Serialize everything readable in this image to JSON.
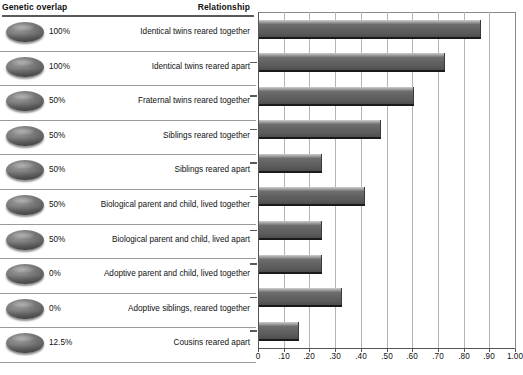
{
  "table": {
    "headers": {
      "overlap": "Genetic overlap",
      "relationship": "Relationship"
    },
    "rows": [
      {
        "overlap": "100%",
        "relationship": "Identical twins reared together"
      },
      {
        "overlap": "100%",
        "relationship": "Identical twins reared apart"
      },
      {
        "overlap": "50%",
        "relationship": "Fraternal twins reared together"
      },
      {
        "overlap": "50%",
        "relationship": "Siblings reared together"
      },
      {
        "overlap": "50%",
        "relationship": "Siblings reared apart"
      },
      {
        "overlap": "50%",
        "relationship": "Biological parent and child, lived together"
      },
      {
        "overlap": "50%",
        "relationship": "Biological parent and child, lived apart"
      },
      {
        "overlap": "0%",
        "relationship": "Adoptive parent and child, lived together"
      },
      {
        "overlap": "0%",
        "relationship": "Adoptive siblings, reared together"
      },
      {
        "overlap": "12.5%",
        "relationship": "Cousins reared apart"
      }
    ]
  },
  "chart_data": {
    "type": "bar",
    "orientation": "horizontal",
    "title": "",
    "xlabel": "",
    "ylabel": "",
    "xlim": [
      0,
      1.0
    ],
    "grid": true,
    "legend": "none",
    "categories": [
      "Identical twins reared together",
      "Identical twins reared apart",
      "Fraternal twins reared together",
      "Siblings reared together",
      "Siblings reared apart",
      "Biological parent and child, lived together",
      "Biological parent and child, lived apart",
      "Adoptive parent and child, lived together",
      "Adoptive siblings, reared together",
      "Cousins reared apart"
    ],
    "values": [
      0.86,
      0.72,
      0.6,
      0.47,
      0.24,
      0.41,
      0.24,
      0.24,
      0.32,
      0.15
    ],
    "tick_values": [
      0,
      0.1,
      0.2,
      0.3,
      0.4,
      0.5,
      0.6,
      0.7,
      0.8,
      0.9,
      1.0
    ],
    "tick_labels": [
      "0",
      ".10",
      ".20",
      ".30",
      ".40",
      ".50",
      ".60",
      ".70",
      ".80",
      ".90",
      "1.00"
    ],
    "bar_color": "#616161"
  }
}
